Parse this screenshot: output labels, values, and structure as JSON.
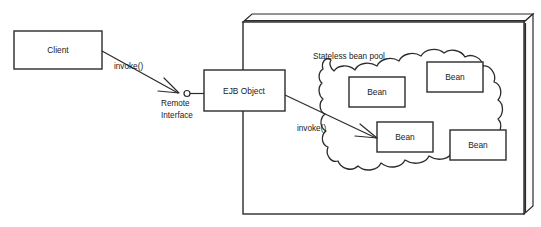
{
  "diagram": {
    "type": "uml-component-diagram",
    "background_color": "#ffffff",
    "stroke_color": "#2b2b2b",
    "text_color": "#1a1a1a",
    "nodes": {
      "client": {
        "label": "Client",
        "shape": "rectangle"
      },
      "ejb_object": {
        "label": "EJB Object",
        "shape": "rectangle"
      },
      "container": {
        "label": "",
        "shape": "3d-box"
      },
      "pool": {
        "label": "Stateless bean pool",
        "shape": "cloud"
      },
      "beans": [
        {
          "label": "Bean"
        },
        {
          "label": "Bean"
        },
        {
          "label": "Bean"
        },
        {
          "label": "Bean"
        }
      ]
    },
    "edges": {
      "client_to_remote": {
        "label": "invoke()",
        "from": "client",
        "to": "remote-interface"
      },
      "remote_interface": {
        "label_line1": "Remote",
        "label_line2": "Interface",
        "notation": "lollipop"
      },
      "ejb_to_bean": {
        "label": "invoke()",
        "from": "ejb_object",
        "to": "bean-3"
      }
    }
  }
}
